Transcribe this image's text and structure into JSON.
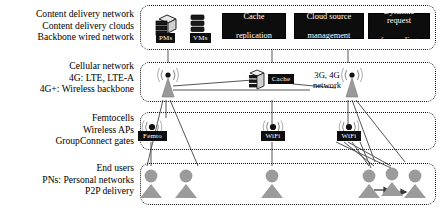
{
  "diagram": {
    "colors": {
      "box_fill": "#0d0d0d",
      "box_text": "#ffffff",
      "band_border": "#111111",
      "icon_gray": "#8c8c8c",
      "wire": "#555555",
      "background": "#ffffff"
    },
    "layers": [
      {
        "id": "cdn",
        "labels": [
          "Content delivery network",
          "Content delivery clouds",
          "Backbone wired network"
        ],
        "nodes": [
          {
            "id": "pms",
            "chip": "PMs",
            "icon": "physical-server-icon"
          },
          {
            "id": "vms",
            "chip": "VMs",
            "icon": "virtual-machine-stack-icon"
          }
        ],
        "functions": [
          {
            "id": "cache-replication",
            "lines": [
              "Cache",
              "replication"
            ]
          },
          {
            "id": "cloud-source-management",
            "lines": [
              "Cloud source",
              "management"
            ]
          },
          {
            "id": "dynamic-request-forwarding",
            "lines": [
              "Dynamic request",
              "forwarding"
            ]
          }
        ]
      },
      {
        "id": "cellular",
        "labels": [
          "Cellular network",
          "4G: LTE, LTE-A",
          "4G+: Wireless backbone"
        ],
        "nodes": [
          {
            "id": "tower-1",
            "icon": "cell-tower-icon"
          },
          {
            "id": "edge-cache",
            "chip": "Cache",
            "icon": "server-icon"
          },
          {
            "id": "tower-2",
            "icon": "cell-tower-icon"
          },
          {
            "id": "tower-3",
            "icon": "cell-tower-icon"
          }
        ],
        "annotation": {
          "id": "network-generation",
          "lines": [
            "3G, 4G",
            "network"
          ]
        }
      },
      {
        "id": "access",
        "labels": [
          "Femtocells",
          "Wireless APs",
          "GroupConnect gates"
        ],
        "nodes": [
          {
            "id": "femto-ap",
            "chip": "Femto",
            "icon": "access-point-icon"
          },
          {
            "id": "wifi-ap-1",
            "chip": "WiFi",
            "icon": "access-point-icon"
          },
          {
            "id": "wifi-ap-2",
            "chip": "WiFi",
            "icon": "access-point-icon"
          }
        ]
      },
      {
        "id": "users",
        "labels": [
          "End users",
          "PNs: Personal networks",
          "P2P delivery"
        ],
        "nodes": [
          {
            "id": "user-1",
            "icon": "user-icon"
          },
          {
            "id": "user-2",
            "icon": "user-icon"
          },
          {
            "id": "user-3",
            "icon": "user-icon"
          },
          {
            "id": "user-4",
            "icon": "user-icon"
          },
          {
            "id": "user-5",
            "icon": "user-icon"
          },
          {
            "id": "user-6",
            "icon": "user-icon"
          }
        ],
        "p2p_links": [
          {
            "from": "user-4",
            "to": "user-5"
          },
          {
            "from": "user-5",
            "to": "user-6"
          }
        ]
      }
    ]
  }
}
